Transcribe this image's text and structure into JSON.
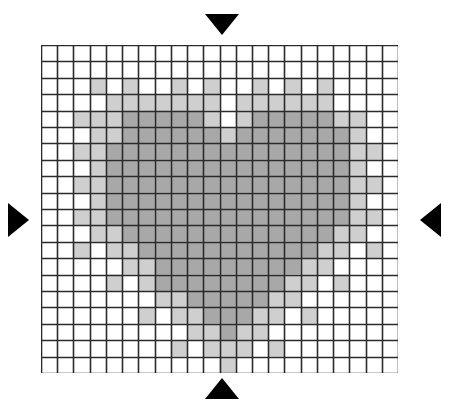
{
  "page": {
    "background_color": "#ffffff",
    "width": 449,
    "height": 407,
    "faint_header_text": ""
  },
  "grid": {
    "columns": 22,
    "rows": 20,
    "cell_width": 16.23,
    "cell_height": 16.4,
    "origin_x": 41,
    "origin_y": 45,
    "line_color": "#2b2b2b",
    "line_width": 1.6,
    "legend": [
      {
        "code": 0,
        "name": "empty",
        "color": "#ffffff",
        "label": "Background"
      },
      {
        "code": 1,
        "name": "light",
        "color": "#cfcfcf",
        "label": "Light shade"
      },
      {
        "code": 2,
        "name": "medium",
        "color": "#a8a8a8",
        "label": "Medium shade"
      },
      {
        "code": 3,
        "name": "dark",
        "color": "#6b6b6b",
        "label": "Dark shade"
      }
    ],
    "cells": [
      [
        0,
        0,
        0,
        0,
        0,
        0,
        0,
        0,
        0,
        0,
        0,
        0,
        0,
        0,
        0,
        0,
        0,
        0,
        0,
        0,
        0,
        0
      ],
      [
        0,
        0,
        0,
        0,
        0,
        0,
        0,
        0,
        0,
        0,
        0,
        0,
        0,
        0,
        0,
        0,
        0,
        0,
        0,
        0,
        0,
        0
      ],
      [
        0,
        0,
        0,
        1,
        0,
        1,
        0,
        0,
        1,
        0,
        1,
        0,
        0,
        1,
        0,
        1,
        0,
        1,
        0,
        0,
        0,
        0
      ],
      [
        0,
        0,
        0,
        0,
        1,
        1,
        1,
        1,
        1,
        1,
        1,
        0,
        1,
        1,
        1,
        1,
        1,
        1,
        0,
        0,
        0,
        0
      ],
      [
        0,
        0,
        1,
        1,
        1,
        2,
        2,
        2,
        2,
        2,
        1,
        0,
        1,
        2,
        2,
        2,
        2,
        2,
        1,
        1,
        0,
        0
      ],
      [
        0,
        0,
        0,
        1,
        1,
        2,
        2,
        2,
        2,
        2,
        2,
        1,
        2,
        2,
        2,
        2,
        2,
        2,
        2,
        1,
        0,
        0
      ],
      [
        0,
        0,
        1,
        1,
        2,
        2,
        2,
        2,
        2,
        2,
        2,
        2,
        2,
        2,
        2,
        2,
        2,
        2,
        2,
        1,
        1,
        0
      ],
      [
        0,
        0,
        0,
        1,
        2,
        2,
        2,
        2,
        2,
        2,
        2,
        2,
        2,
        2,
        2,
        2,
        2,
        2,
        2,
        1,
        0,
        0
      ],
      [
        0,
        0,
        1,
        1,
        2,
        2,
        2,
        2,
        2,
        2,
        2,
        2,
        2,
        2,
        2,
        2,
        2,
        2,
        2,
        1,
        1,
        0
      ],
      [
        0,
        0,
        0,
        1,
        2,
        2,
        2,
        2,
        2,
        2,
        2,
        2,
        2,
        2,
        2,
        2,
        2,
        2,
        2,
        1,
        0,
        0
      ],
      [
        0,
        0,
        1,
        1,
        2,
        2,
        2,
        2,
        2,
        2,
        2,
        2,
        2,
        2,
        2,
        2,
        2,
        2,
        2,
        1,
        1,
        0
      ],
      [
        0,
        0,
        0,
        1,
        1,
        2,
        2,
        2,
        2,
        2,
        2,
        2,
        2,
        2,
        2,
        2,
        2,
        2,
        1,
        1,
        0,
        0
      ],
      [
        0,
        0,
        1,
        0,
        1,
        1,
        2,
        2,
        2,
        2,
        2,
        2,
        2,
        2,
        2,
        2,
        2,
        1,
        1,
        0,
        1,
        0
      ],
      [
        0,
        0,
        0,
        0,
        0,
        1,
        1,
        2,
        2,
        2,
        2,
        2,
        2,
        2,
        2,
        2,
        1,
        1,
        0,
        0,
        0,
        0
      ],
      [
        0,
        0,
        0,
        0,
        1,
        0,
        1,
        2,
        2,
        2,
        2,
        2,
        2,
        2,
        2,
        1,
        1,
        0,
        1,
        0,
        0,
        0
      ],
      [
        0,
        0,
        0,
        0,
        0,
        0,
        0,
        1,
        1,
        2,
        2,
        2,
        2,
        2,
        1,
        1,
        0,
        0,
        0,
        0,
        0,
        0
      ],
      [
        0,
        0,
        0,
        0,
        0,
        0,
        1,
        0,
        1,
        1,
        2,
        2,
        2,
        1,
        1,
        0,
        1,
        0,
        0,
        0,
        0,
        0
      ],
      [
        0,
        0,
        0,
        0,
        0,
        0,
        0,
        0,
        0,
        1,
        1,
        2,
        1,
        1,
        0,
        0,
        0,
        0,
        0,
        0,
        0,
        0
      ],
      [
        0,
        0,
        0,
        0,
        0,
        0,
        0,
        0,
        1,
        0,
        1,
        1,
        1,
        0,
        1,
        0,
        0,
        0,
        0,
        0,
        0,
        0
      ],
      [
        0,
        0,
        0,
        0,
        0,
        0,
        0,
        0,
        0,
        0,
        0,
        1,
        0,
        0,
        0,
        0,
        0,
        0,
        0,
        0,
        0,
        0
      ]
    ]
  },
  "markers": {
    "color": "#000000",
    "items": [
      {
        "name": "top-marker",
        "direction": "down",
        "label": "Top alignment marker"
      },
      {
        "name": "bottom-marker",
        "direction": "up",
        "label": "Bottom alignment marker"
      },
      {
        "name": "left-marker",
        "direction": "right",
        "label": "Left alignment marker"
      },
      {
        "name": "right-marker",
        "direction": "left",
        "label": "Right alignment marker"
      }
    ]
  }
}
